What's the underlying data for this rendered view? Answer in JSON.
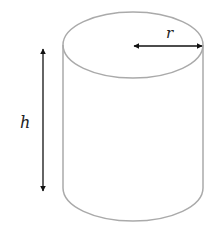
{
  "diagram": {
    "labels": {
      "radius": "r",
      "height": "h"
    },
    "colors": {
      "outline": "#aaaaaa",
      "arrow": "#111111",
      "background": "#ffffff"
    }
  }
}
